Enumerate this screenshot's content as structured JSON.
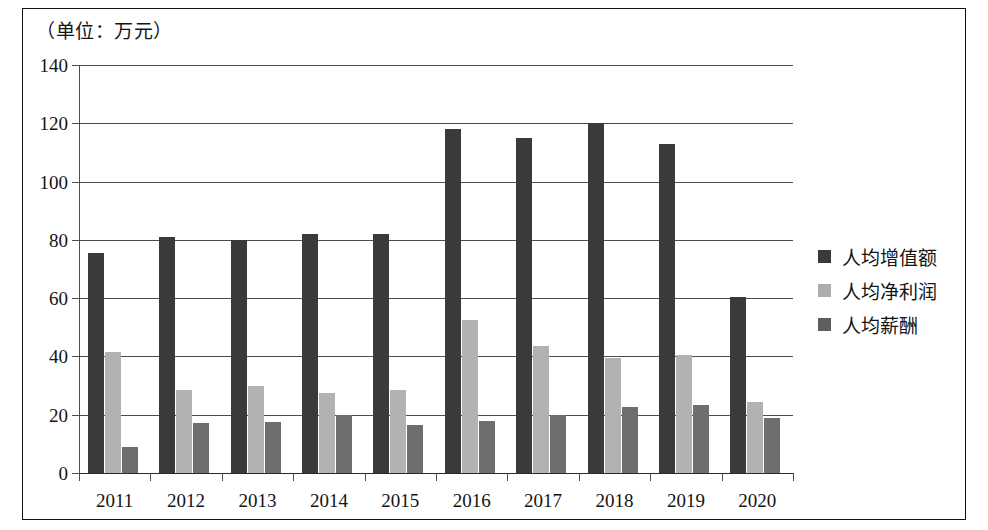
{
  "figure": {
    "unit_note": "（单位：万元）"
  },
  "chart_data": {
    "type": "bar",
    "title": "",
    "subtitle": "",
    "xlabel": "",
    "ylabel": "（单位：万元）",
    "categories": [
      "2011",
      "2012",
      "2013",
      "2014",
      "2015",
      "2016",
      "2017",
      "2018",
      "2019",
      "2020"
    ],
    "series": [
      {
        "name": "人均增值额",
        "color": "#3a3a3a",
        "values": [
          75.5,
          81,
          80,
          82,
          82,
          118,
          115,
          120,
          113,
          60.5
        ]
      },
      {
        "name": "人均净利润",
        "color": "#b2b2b2",
        "values": [
          41.5,
          28.5,
          30,
          27.5,
          28.5,
          52.5,
          43.5,
          39.5,
          40.5,
          24.5
        ]
      },
      {
        "name": "人均薪酬",
        "color": "#6e6e6e",
        "values": [
          9,
          17,
          17.5,
          20,
          16.5,
          18,
          20,
          22.5,
          23.5,
          19
        ]
      }
    ],
    "ylim": [
      0,
      140
    ],
    "yticks": [
      0,
      20,
      40,
      60,
      80,
      100,
      120,
      140
    ],
    "ytick_labels": [
      "0",
      "20",
      "40",
      "60",
      "80",
      "100",
      "120",
      "140"
    ],
    "grid": true,
    "grid_axis": "y",
    "legend_position": "right"
  }
}
